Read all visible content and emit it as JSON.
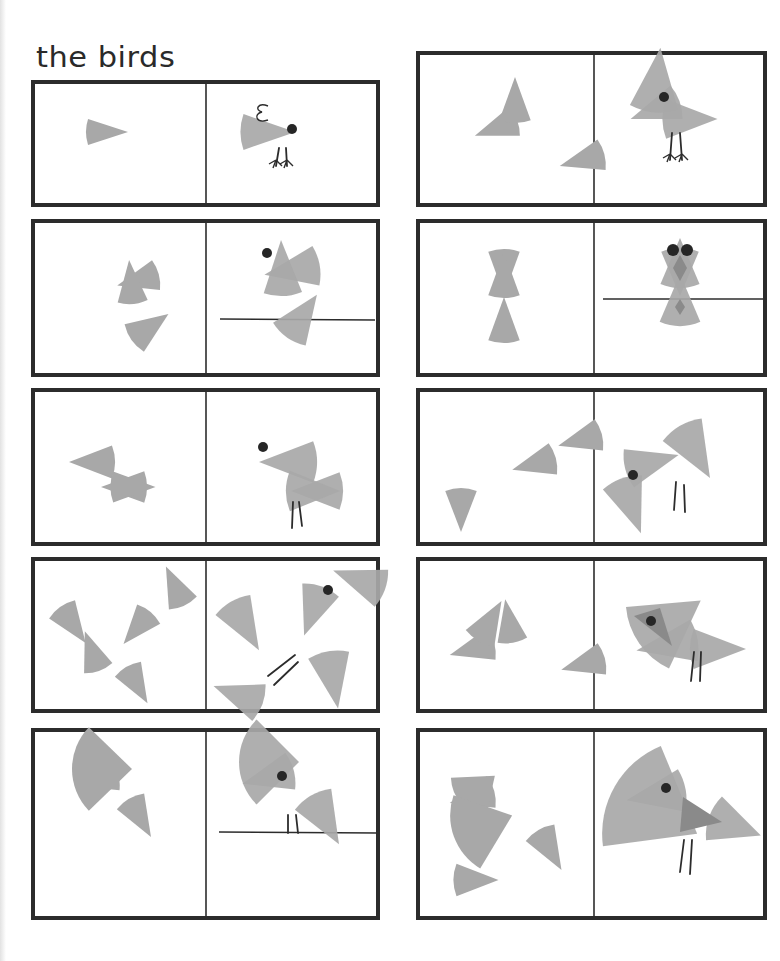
{
  "page": {
    "title": "the birds"
  },
  "colors": {
    "shape": "#a8a8a8",
    "shape_dark": "#8a8a8a",
    "ink": "#2c2c2c",
    "eye": "#262626"
  },
  "panels": [
    {
      "id": "panel-1-tiny-chick",
      "box": [
        33,
        82,
        378,
        205
      ],
      "divider": 206,
      "pieces": [
        {
          "cx": 107,
          "cy": 132,
          "r": 42,
          "dir": 0,
          "span": 36
        }
      ],
      "bird": {
        "wedges": [
          {
            "cx": 268,
            "cy": 132,
            "r": 55,
            "dir": 0,
            "span": 38
          }
        ],
        "eyes": [
          [
            292,
            129
          ]
        ],
        "legs": [
          [
            279,
            148,
            276,
            166
          ],
          [
            286,
            148,
            287,
            166
          ]
        ],
        "feet": true,
        "curl": [
          262,
          112
        ]
      }
    },
    {
      "id": "panel-2-three-wedges",
      "box": [
        418,
        53,
        765,
        205
      ],
      "divider": 594,
      "pieces": [
        {
          "cx": 496,
          "cy": 128,
          "r": 45,
          "dir": 200,
          "span": 40
        },
        {
          "cx": 515,
          "cy": 100,
          "r": 46,
          "dir": 90,
          "span": 40
        },
        {
          "cx": 582,
          "cy": 160,
          "r": 46,
          "dir": 195,
          "span": 40
        }
      ],
      "bird": {
        "wedges": [
          {
            "cx": 655,
            "cy": 110,
            "r": 52,
            "dir": 200,
            "span": 40
          },
          {
            "cx": 657,
            "cy": 80,
            "r": 65,
            "dir": 84,
            "span": 44
          },
          {
            "cx": 690,
            "cy": 119,
            "r": 55,
            "dir": 0,
            "span": 42
          }
        ],
        "eyes": [
          [
            664,
            97
          ]
        ],
        "legs": [
          [
            672,
            133,
            670,
            160
          ],
          [
            680,
            133,
            682,
            160
          ]
        ],
        "feet": true
      }
    },
    {
      "id": "panel-3-perching",
      "box": [
        33,
        221,
        378,
        375
      ],
      "divider": 206,
      "pieces": [
        {
          "cx": 138,
          "cy": 280,
          "r": 43,
          "dir": 195,
          "span": 42
        },
        {
          "cx": 131,
          "cy": 282,
          "r": 44,
          "dir": 95,
          "span": 40
        },
        {
          "cx": 150,
          "cy": 327,
          "r": 45,
          "dir": 35,
          "span": 44
        }
      ],
      "bird": {
        "wedges": [
          {
            "cx": 292,
            "cy": 270,
            "r": 56,
            "dir": 190,
            "span": 42
          },
          {
            "cx": 282,
            "cy": 268,
            "r": 56,
            "dir": 92,
            "span": 40
          },
          {
            "cx": 302,
            "cy": 316,
            "r": 52,
            "dir": 55,
            "span": 45
          }
        ],
        "eyes": [
          [
            267,
            253
          ]
        ],
        "perch": [
          220,
          319,
          375,
          320
        ]
      }
    },
    {
      "id": "panel-4-owl",
      "box": [
        418,
        221,
        765,
        375
      ],
      "divider": 594,
      "pieces": [
        {
          "cx": 504,
          "cy": 272,
          "r": 46,
          "dir": 270,
          "span": 40
        },
        {
          "cx": 504,
          "cy": 275,
          "r": 46,
          "dir": 90,
          "span": 40
        },
        {
          "cx": 504,
          "cy": 320,
          "r": 46,
          "dir": 90,
          "span": 40
        }
      ],
      "bird": {
        "wedges": [
          {
            "cx": 680,
            "cy": 272,
            "r": 48,
            "dir": 270,
            "span": 46
          },
          {
            "cx": 680,
            "cy": 263,
            "r": 50,
            "dir": 90,
            "span": 46
          },
          {
            "cx": 680,
            "cy": 300,
            "r": 52,
            "dir": 90,
            "span": 46
          }
        ],
        "darkDiamonds": [
          [
            680,
            268,
            7,
            13
          ],
          [
            680,
            307,
            5,
            8
          ]
        ],
        "eyes": [
          [
            673,
            250
          ],
          [
            687,
            250
          ]
        ],
        "eyeR": 6,
        "perch": [
          603,
          299,
          766,
          299
        ]
      }
    },
    {
      "id": "panel-5-bow-tie",
      "box": [
        33,
        390,
        378,
        544
      ],
      "divider": 206,
      "pieces": [
        {
          "cx": 92,
          "cy": 462,
          "r": 46,
          "dir": 180,
          "span": 42
        },
        {
          "cx": 124,
          "cy": 487,
          "r": 46,
          "dir": 180,
          "span": 40
        },
        {
          "cx": 133,
          "cy": 487,
          "r": 45,
          "dir": 0,
          "span": 40
        }
      ],
      "bird": {
        "wedges": [
          {
            "cx": 288,
            "cy": 462,
            "r": 58,
            "dir": 180,
            "span": 42
          },
          {
            "cx": 317,
            "cy": 491,
            "r": 52,
            "dir": 180,
            "span": 42
          },
          {
            "cx": 313,
            "cy": 491,
            "r": 54,
            "dir": 0,
            "span": 44
          }
        ],
        "eyes": [
          [
            263,
            447
          ]
        ],
        "legs": [
          [
            293,
            502,
            292,
            528
          ],
          [
            299,
            502,
            302,
            526
          ]
        ]
      }
    },
    {
      "id": "panel-6-tall-tail",
      "box": [
        418,
        390,
        765,
        544
      ],
      "divider": 594,
      "pieces": [
        {
          "cx": 461,
          "cy": 510,
          "r": 44,
          "dir": 270,
          "span": 42
        },
        {
          "cx": 534,
          "cy": 464,
          "r": 45,
          "dir": 195,
          "span": 42
        },
        {
          "cx": 580,
          "cy": 440,
          "r": 45,
          "dir": 195,
          "span": 42
        }
      ],
      "bird": {
        "wedges": [
          {
            "cx": 631,
            "cy": 506,
            "r": 58,
            "dir": 290,
            "span": 42
          },
          {
            "cx": 652,
            "cy": 462,
            "r": 55,
            "dir": 15,
            "span": 42
          },
          {
            "cx": 695,
            "cy": 452,
            "r": 60,
            "dir": 300,
            "span": 44
          }
        ],
        "eyes": [
          [
            633,
            475
          ]
        ],
        "legs": [
          [
            676,
            482,
            674,
            510
          ],
          [
            684,
            485,
            685,
            512
          ]
        ]
      }
    },
    {
      "id": "panel-7-flying",
      "box": [
        33,
        559,
        378,
        711
      ],
      "divider": 206,
      "pieces": [
        {
          "cx": 73,
          "cy": 625,
          "r": 44,
          "dir": 305,
          "span": 42
        },
        {
          "cx": 175,
          "cy": 586,
          "r": 43,
          "dir": 115,
          "span": 42
        },
        {
          "cx": 137,
          "cy": 628,
          "r": 42,
          "dir": 230,
          "span": 42
        },
        {
          "cx": 92,
          "cy": 651,
          "r": 42,
          "dir": 110,
          "span": 42
        },
        {
          "cx": 137,
          "cy": 685,
          "r": 42,
          "dir": 300,
          "span": 42
        }
      ],
      "bird": {
        "wedges": [
          {
            "cx": 245,
            "cy": 626,
            "r": 56,
            "dir": 300,
            "span": 42
          },
          {
            "cx": 359,
            "cy": 580,
            "r": 55,
            "dir": 160,
            "span": 42
          },
          {
            "cx": 313,
            "cy": 611,
            "r": 52,
            "dir": 250,
            "span": 44
          },
          {
            "cx": 333,
            "cy": 680,
            "r": 58,
            "dir": 280,
            "span": 42
          },
          {
            "cx": 238,
            "cy": 695,
            "r": 52,
            "dir": 160,
            "span": 44
          }
        ],
        "eyes": [
          [
            328,
            590
          ]
        ],
        "legs": [
          [
            268,
            676,
            295,
            655
          ],
          [
            274,
            685,
            298,
            662
          ]
        ]
      }
    },
    {
      "id": "panel-8-dark-eye-patch",
      "box": [
        418,
        559,
        765,
        711
      ],
      "divider": 594,
      "pieces": [
        {
          "cx": 472,
          "cy": 649,
          "r": 46,
          "dir": 195,
          "span": 42
        },
        {
          "cx": 490,
          "cy": 621,
          "r": 46,
          "dir": 60,
          "span": 42
        },
        {
          "cx": 509,
          "cy": 621,
          "r": 44,
          "dir": 100,
          "span": 40
        },
        {
          "cx": 583,
          "cy": 664,
          "r": 45,
          "dir": 195,
          "span": 42
        }
      ],
      "bird": {
        "wedges": [
          {
            "cx": 667,
            "cy": 645,
            "r": 62,
            "dir": 190,
            "span": 40
          },
          {
            "cx": 670,
            "cy": 622,
            "r": 75,
            "dir": 35,
            "span": 60
          },
          {
            "cx": 718,
            "cy": 649,
            "r": 56,
            "dir": 0,
            "span": 42
          }
        ],
        "darkTri": [
          [
            634,
            616
          ],
          [
            660,
            608
          ],
          [
            672,
            646
          ]
        ],
        "eyes": [
          [
            651,
            621
          ]
        ],
        "legs": [
          [
            694,
            652,
            691,
            681
          ],
          [
            701,
            652,
            700,
            681
          ]
        ]
      }
    },
    {
      "id": "panel-9-big-beak-perch",
      "box": [
        33,
        730,
        378,
        918
      ],
      "divider": 206,
      "pieces": [
        {
          "cx": 97,
          "cy": 780,
          "r": 44,
          "dir": 195,
          "span": 42
        },
        {
          "cx": 102,
          "cy": 769,
          "r": 60,
          "dir": 0,
          "span": 88
        },
        {
          "cx": 140,
          "cy": 818,
          "r": 44,
          "dir": 300,
          "span": 42
        }
      ],
      "bird": {
        "wedges": [
          {
            "cx": 268,
            "cy": 777,
            "r": 53,
            "dir": 195,
            "span": 42
          },
          {
            "cx": 269,
            "cy": 762,
            "r": 60,
            "dir": 0,
            "span": 90
          },
          {
            "cx": 325,
            "cy": 820,
            "r": 56,
            "dir": 300,
            "span": 44
          }
        ],
        "eyes": [
          [
            282,
            776
          ]
        ],
        "legs": [
          [
            288,
            815,
            288,
            833
          ],
          [
            296,
            815,
            298,
            833
          ]
        ],
        "perch": [
          219,
          832,
          378,
          833
        ]
      }
    },
    {
      "id": "panel-10-big-bird",
      "box": [
        418,
        730,
        765,
        918
      ],
      "divider": 594,
      "pieces": [
        {
          "cx": 472,
          "cy": 797,
          "r": 46,
          "dir": 195,
          "span": 42
        },
        {
          "cx": 478,
          "cy": 790,
          "r": 44,
          "dir": 40,
          "span": 75
        },
        {
          "cx": 483,
          "cy": 826,
          "r": 62,
          "dir": 20,
          "span": 78
        },
        {
          "cx": 550,
          "cy": 850,
          "r": 46,
          "dir": 300,
          "span": 42
        },
        {
          "cx": 476,
          "cy": 880,
          "r": 45,
          "dir": 0,
          "span": 42
        }
      ],
      "bird": {
        "wedges": [
          {
            "cx": 656,
            "cy": 795,
            "r": 60,
            "dir": 190,
            "span": 42
          },
          {
            "cx": 656,
            "cy": 810,
            "r": 95,
            "dir": 330,
            "span": 75
          },
          {
            "cx": 735,
            "cy": 826,
            "r": 55,
            "dir": 340,
            "span": 50
          }
        ],
        "darkTri": [
          [
            683,
            797
          ],
          [
            680,
            832
          ],
          [
            722,
            822
          ]
        ],
        "eyes": [
          [
            666,
            788
          ]
        ],
        "legs": [
          [
            684,
            840,
            680,
            872
          ],
          [
            692,
            840,
            690,
            874
          ]
        ]
      }
    }
  ]
}
